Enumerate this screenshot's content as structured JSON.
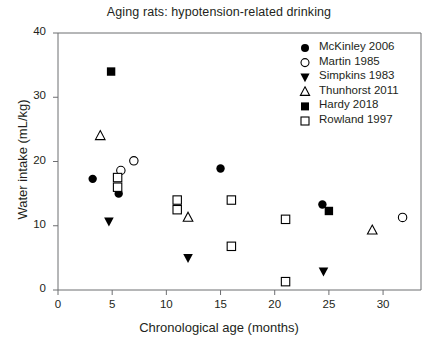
{
  "chart_data": {
    "type": "scatter",
    "title": "Aging rats: hypotension-related drinking",
    "xlabel": "Chronological age (months)",
    "ylabel": "Water intake (mL/kg)",
    "xlim": [
      0,
      33.5
    ],
    "ylim": [
      0,
      40
    ],
    "xticks": [
      0,
      5,
      10,
      15,
      20,
      25,
      30
    ],
    "yticks": [
      0,
      10,
      20,
      30,
      40
    ],
    "grid": false,
    "legend_position": "top-right",
    "series": [
      {
        "name": "McKinley 2006",
        "marker": "filled-circle",
        "color": "#000000",
        "points": [
          {
            "x": 3.2,
            "y": 17.3
          },
          {
            "x": 5.6,
            "y": 15.0
          },
          {
            "x": 15.0,
            "y": 18.9
          },
          {
            "x": 24.4,
            "y": 13.3
          }
        ]
      },
      {
        "name": "Martin 1985",
        "marker": "open-circle",
        "color": "#000000",
        "points": [
          {
            "x": 5.8,
            "y": 18.6
          },
          {
            "x": 7.0,
            "y": 20.1
          },
          {
            "x": 31.8,
            "y": 11.3
          }
        ]
      },
      {
        "name": "Simpkins 1983",
        "marker": "filled-down-triangle",
        "color": "#000000",
        "points": [
          {
            "x": 4.7,
            "y": 10.7
          },
          {
            "x": 12.0,
            "y": 5.0
          },
          {
            "x": 24.5,
            "y": 2.9
          }
        ]
      },
      {
        "name": "Thunhorst 2011",
        "marker": "open-up-triangle",
        "color": "#000000",
        "points": [
          {
            "x": 3.9,
            "y": 24.0
          },
          {
            "x": 12.0,
            "y": 11.3
          },
          {
            "x": 29.0,
            "y": 9.3
          }
        ]
      },
      {
        "name": "Hardy 2018",
        "marker": "filled-square",
        "color": "#000000",
        "points": [
          {
            "x": 4.9,
            "y": 34.0
          },
          {
            "x": 25.0,
            "y": 12.3
          }
        ]
      },
      {
        "name": "Rowland 1997",
        "marker": "open-square",
        "color": "#000000",
        "points": [
          {
            "x": 5.5,
            "y": 17.5
          },
          {
            "x": 5.5,
            "y": 16.0
          },
          {
            "x": 11.0,
            "y": 14.0
          },
          {
            "x": 11.0,
            "y": 12.5
          },
          {
            "x": 16.0,
            "y": 14.0
          },
          {
            "x": 16.0,
            "y": 6.8
          },
          {
            "x": 21.0,
            "y": 11.0
          },
          {
            "x": 21.0,
            "y": 1.3
          }
        ]
      }
    ]
  },
  "axis": {
    "y_tick_labels": [
      "0",
      "10",
      "20",
      "30",
      "40"
    ],
    "x_tick_labels": [
      "0",
      "5",
      "10",
      "15",
      "20",
      "25",
      "30"
    ]
  },
  "legend": {
    "items": [
      {
        "label": "McKinley 2006",
        "marker": "filled-circle"
      },
      {
        "label": "Martin 1985",
        "marker": "open-circle"
      },
      {
        "label": "Simpkins 1983",
        "marker": "filled-down-triangle"
      },
      {
        "label": "Thunhorst 2011",
        "marker": "open-up-triangle"
      },
      {
        "label": "Hardy 2018",
        "marker": "filled-square"
      },
      {
        "label": "Rowland 1997",
        "marker": "open-square"
      }
    ]
  },
  "style": {
    "axis_color": "#6d6e71",
    "marker_color": "#000000",
    "text_color": "#231f20"
  }
}
